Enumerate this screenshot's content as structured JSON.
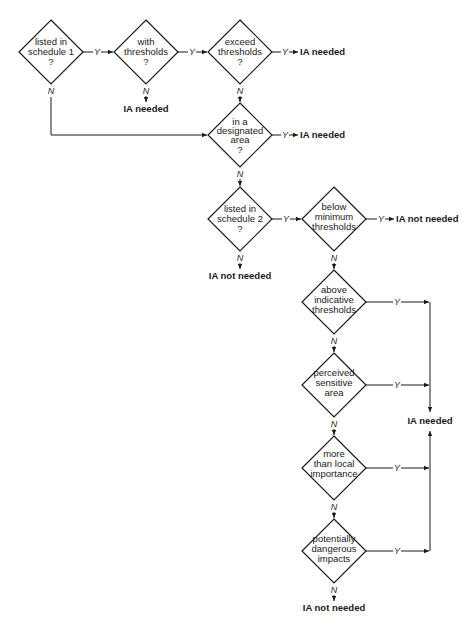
{
  "diagram": {
    "type": "flowchart",
    "colors": {
      "line": "#1a1a1a",
      "background": "#ffffff"
    },
    "decisions": [
      {
        "id": "d1",
        "lines": [
          "listed in",
          "schedule 1",
          "?"
        ]
      },
      {
        "id": "d2",
        "lines": [
          "with",
          "thresholds",
          "?"
        ]
      },
      {
        "id": "d3",
        "lines": [
          "exceed",
          "thresholds",
          "?"
        ]
      },
      {
        "id": "d4",
        "lines": [
          "in a",
          "designated",
          "area",
          "?"
        ]
      },
      {
        "id": "d5",
        "lines": [
          "listed in",
          "schedule 2",
          "?"
        ]
      },
      {
        "id": "d6",
        "lines": [
          "below",
          "minimum",
          "thresholds"
        ]
      },
      {
        "id": "d7",
        "lines": [
          "above",
          "indicative",
          "thresholds"
        ]
      },
      {
        "id": "d8",
        "lines": [
          "perceived",
          "sensitive",
          "area"
        ]
      },
      {
        "id": "d9",
        "lines": [
          "more",
          "than local",
          "importance"
        ]
      },
      {
        "id": "d10",
        "lines": [
          "potentially",
          "dangerous",
          "impacts"
        ]
      }
    ],
    "outcomes": {
      "d2_no": "IA needed",
      "d3_yes": "IA needed",
      "d4_yes": "IA needed",
      "d5_no": "IA not needed",
      "d6_yes": "IA not needed",
      "merged_yes": "IA needed",
      "d10_no": "IA not needed"
    },
    "edge_labels": {
      "yes": "Y",
      "no": "N"
    }
  }
}
